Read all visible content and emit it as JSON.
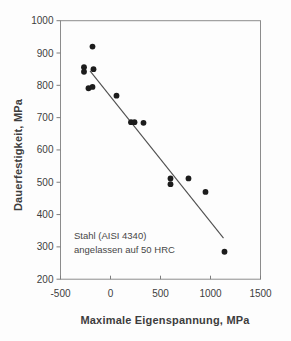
{
  "chart_data": {
    "type": "scatter",
    "xlabel": "Maximale Eigenspannung, MPa",
    "ylabel": "Dauerfestigkeit, MPa",
    "xlim": [
      -500,
      1500
    ],
    "ylim": [
      200,
      1000
    ],
    "x_ticks": [
      -500,
      0,
      500,
      1000,
      1500
    ],
    "y_ticks": [
      200,
      300,
      400,
      500,
      600,
      700,
      800,
      900,
      1000
    ],
    "grid": false,
    "legend": "none",
    "annotation": {
      "line1": "Stahl (AISI 4340)",
      "line2": "angelassen auf 50 HRC"
    },
    "points": [
      {
        "x": -180,
        "y": 920
      },
      {
        "x": -265,
        "y": 856
      },
      {
        "x": -265,
        "y": 842
      },
      {
        "x": -170,
        "y": 850
      },
      {
        "x": -220,
        "y": 791
      },
      {
        "x": -180,
        "y": 795
      },
      {
        "x": 60,
        "y": 768
      },
      {
        "x": 205,
        "y": 686
      },
      {
        "x": 240,
        "y": 686
      },
      {
        "x": 330,
        "y": 684
      },
      {
        "x": 600,
        "y": 512
      },
      {
        "x": 600,
        "y": 494
      },
      {
        "x": 780,
        "y": 512
      },
      {
        "x": 950,
        "y": 470
      },
      {
        "x": 1140,
        "y": 285
      }
    ],
    "trend_line": {
      "x1": -205,
      "y1": 845,
      "x2": 1130,
      "y2": 327
    },
    "colors": {
      "point": "#1c1c1c",
      "line": "#4f4f4f",
      "frame": "#8c8c8c",
      "tick": "#7d7d7d",
      "text": "#3d3d3d",
      "background": "#fdfdfd"
    }
  }
}
